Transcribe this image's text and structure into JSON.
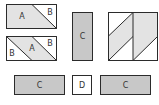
{
  "colors": {
    "light_fill": "#e3e3e3",
    "mid_fill": "#c8c8c8",
    "white_fill": "#ffffff",
    "stroke": "#2b2b2b"
  },
  "units": {
    "unit_1": {
      "labels": [
        "A",
        "B"
      ]
    },
    "unit_2": {
      "labels": [
        "B",
        "A",
        "B"
      ]
    },
    "center_column": {
      "label": "C"
    },
    "completed_block": {
      "label": ""
    },
    "bottom_row": {
      "left": "C",
      "middle": "D",
      "right": "C"
    }
  }
}
